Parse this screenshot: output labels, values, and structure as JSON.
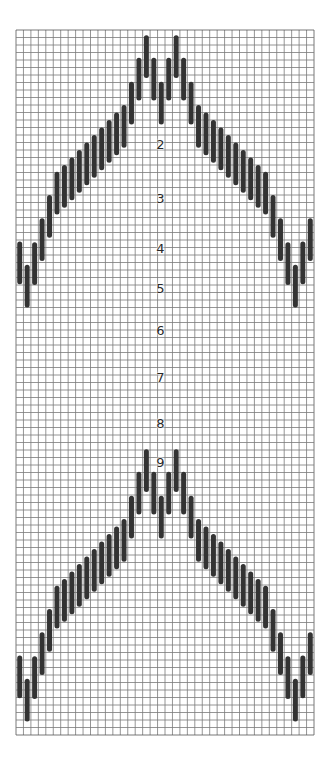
{
  "figure": {
    "type": "knitting-chart",
    "grid": {
      "x0": 16,
      "y0": 30,
      "columns": 40,
      "rows": 94,
      "cell_w": 7.45,
      "cell_h": 7.5,
      "line_color": "#7a7a7a",
      "border_color": "#555555",
      "background": "#ffffff"
    },
    "bar_style": {
      "color": "#333333",
      "width": 5,
      "length_rows": 5.7
    },
    "motif": {
      "description": "Chevron of vertical bars; top offset (in rows) per column 0-39",
      "bar_tops": [
        28.2,
        31.3,
        28.3,
        25.1,
        22.0,
        18.9,
        18.0,
        17.0,
        16.0,
        15.0,
        14.0,
        13.0,
        12.0,
        11.0,
        10.0,
        6.9,
        3.7,
        0.7,
        3.7,
        6.9,
        3.7,
        0.7,
        3.7,
        6.9,
        10.0,
        11.0,
        12.0,
        13.0,
        14.0,
        15.0,
        16.0,
        17.0,
        18.0,
        18.9,
        22.0,
        25.1,
        28.3,
        31.3,
        28.2,
        25.1
      ]
    },
    "motif_repeats": [
      {
        "name": "upper-chevron",
        "row_offset": 0
      },
      {
        "name": "lower-chevron",
        "row_offset": 55.2
      }
    ],
    "row_labels": [
      {
        "text": "2",
        "x": 160.5,
        "y": 144
      },
      {
        "text": "3",
        "x": 160.5,
        "y": 198
      },
      {
        "text": "4",
        "x": 160.5,
        "y": 248
      },
      {
        "text": "5",
        "x": 160.5,
        "y": 288
      },
      {
        "text": "6",
        "x": 160.5,
        "y": 330
      },
      {
        "text": "7",
        "x": 160.5,
        "y": 377
      },
      {
        "text": "8",
        "x": 160.5,
        "y": 423
      },
      {
        "text": "9",
        "x": 160.5,
        "y": 462
      }
    ]
  }
}
